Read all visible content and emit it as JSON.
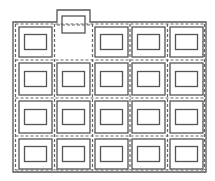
{
  "diagram": {
    "rows": 4,
    "columns": 5,
    "empty_cell": {
      "row": 0,
      "col": 1
    },
    "colors": {
      "stroke": "#555555",
      "dash": "#666666",
      "background": "#ffffff"
    }
  }
}
